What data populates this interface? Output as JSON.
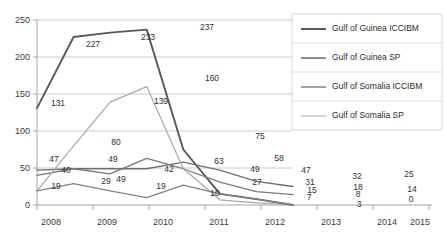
{
  "chart_data": {
    "type": "line",
    "title": "",
    "xlabel": "",
    "ylabel": "",
    "categories": [
      "2008",
      "2009",
      "2010",
      "2011",
      "2012",
      "2013",
      "2014",
      "2015"
    ],
    "ylim": [
      0,
      250
    ],
    "yticks": [
      0,
      50,
      100,
      150,
      200,
      250
    ],
    "grid": true,
    "legend_position": "right",
    "series": [
      {
        "name": "Gulf of Guinea ICCIBM",
        "color": "#595959",
        "width": 1.9,
        "values": [
          131,
          227,
          233,
          237,
          75,
          15,
          8,
          0
        ],
        "labels": [
          "131",
          "227",
          "233",
          "237",
          "75",
          "15",
          "8",
          "0"
        ]
      },
      {
        "name": "Gulf of Guinea SP",
        "color": "#6e6e6e",
        "width": 1.3,
        "values": [
          47,
          49,
          49,
          49,
          58,
          47,
          32,
          25
        ],
        "labels": [
          "47",
          "49",
          "49",
          "49",
          "58",
          "47",
          "32",
          "25"
        ]
      },
      {
        "name": "Gulf of Somalia ICCIBM",
        "color": "#7a7a7a",
        "width": 1.3,
        "values": [
          40,
          49,
          42,
          63,
          49,
          31,
          18,
          14
        ],
        "labels": [
          "40",
          "49",
          "42",
          "63",
          "49",
          "31",
          "18",
          "14"
        ]
      },
      {
        "name": "Gulf of Somalia SP",
        "color": "#a8a8a8",
        "width": 1.2,
        "values": [
          19,
          80,
          139,
          160,
          49,
          7,
          3,
          0
        ],
        "labels": [
          "19",
          "80",
          "139",
          "160",
          "49",
          "7",
          "3",
          "0"
        ]
      },
      {
        "name": "Somalia reports",
        "color": "#828282",
        "width": 1.3,
        "values": [
          19,
          29,
          19,
          10,
          27,
          15,
          8,
          0
        ],
        "labels": [
          "19",
          "29",
          "19",
          "10",
          "27",
          "15",
          "8",
          "0"
        ]
      }
    ],
    "legend_entries": [
      "Gulf of Guinea ICCIBM",
      "Gulf of Guinea SP",
      "Gulf of Somalia ICCIBM",
      "Gulf of Somalia SP"
    ],
    "data_labels": [
      {
        "text": "131",
        "x": 58,
        "y": 106
      },
      {
        "text": "227",
        "x": 93,
        "y": 47
      },
      {
        "text": "233",
        "x": 148,
        "y": 40
      },
      {
        "text": "237",
        "x": 207,
        "y": 30
      },
      {
        "text": "160",
        "x": 212,
        "y": 81
      },
      {
        "text": "139",
        "x": 161,
        "y": 104
      },
      {
        "text": "80",
        "x": 116,
        "y": 145
      },
      {
        "text": "75",
        "x": 260,
        "y": 139
      },
      {
        "text": "58",
        "x": 279,
        "y": 161
      },
      {
        "text": "49",
        "x": 255,
        "y": 172
      },
      {
        "text": "47",
        "x": 306,
        "y": 173
      },
      {
        "text": "47",
        "x": 54,
        "y": 162
      },
      {
        "text": "49",
        "x": 113,
        "y": 162
      },
      {
        "text": "49",
        "x": 121,
        "y": 182
      },
      {
        "text": "42",
        "x": 169,
        "y": 172
      },
      {
        "text": "63",
        "x": 219,
        "y": 164
      },
      {
        "text": "40",
        "x": 66,
        "y": 173
      },
      {
        "text": "29",
        "x": 106,
        "y": 184
      },
      {
        "text": "19",
        "x": 56,
        "y": 189
      },
      {
        "text": "19",
        "x": 161,
        "y": 189
      },
      {
        "text": "10",
        "x": 215,
        "y": 196
      },
      {
        "text": "27",
        "x": 257,
        "y": 185
      },
      {
        "text": "31",
        "x": 310,
        "y": 185
      },
      {
        "text": "15",
        "x": 312,
        "y": 193
      },
      {
        "text": "7",
        "x": 309,
        "y": 200
      },
      {
        "text": "32",
        "x": 357,
        "y": 179
      },
      {
        "text": "18",
        "x": 358,
        "y": 190
      },
      {
        "text": "8",
        "x": 358,
        "y": 197
      },
      {
        "text": "3",
        "x": 359,
        "y": 207
      },
      {
        "text": "25",
        "x": 409,
        "y": 177
      },
      {
        "text": "14",
        "x": 412,
        "y": 192
      },
      {
        "text": "0",
        "x": 411,
        "y": 202
      }
    ]
  },
  "axes": {
    "ytick_labels": [
      "250",
      "200",
      "150",
      "100",
      "50",
      "0"
    ],
    "xtick_labels": [
      "2008",
      "2009",
      "2010",
      "2011",
      "2012",
      "2013",
      "2014",
      "2015"
    ]
  },
  "legend": {
    "items": [
      {
        "label": "Gulf of Guinea ICCIBM",
        "color": "#595959",
        "width": 2.0
      },
      {
        "label": "Gulf of Guinea SP",
        "color": "#6e6e6e",
        "width": 1.6
      },
      {
        "label": "Gulf of Somalia ICCIBM",
        "color": "#7a7a7a",
        "width": 1.4
      },
      {
        "label": "Gulf of Somalia SP",
        "color": "#b0b0b0",
        "width": 1.1
      }
    ]
  },
  "colors": {
    "grid": "#bfbfbf",
    "axis": "#9a9a9a",
    "text": "#2e2e2e",
    "background": "#ffffff"
  }
}
